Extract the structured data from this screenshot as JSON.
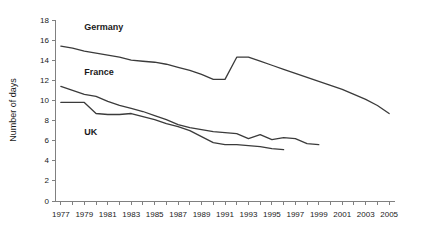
{
  "chart_data": {
    "type": "line",
    "title": "",
    "subtitle": "",
    "xlabel": "",
    "ylabel": "Number of days",
    "xlim": [
      1976.5,
      2005.5
    ],
    "ylim": [
      0,
      18
    ],
    "ytick_step": 2,
    "xtick_step": 1,
    "xlabel_step": 2,
    "grid": false,
    "legend_position": "inline-annotations",
    "yticks": [
      "0",
      "2",
      "4",
      "6",
      "8",
      "10",
      "12",
      "14",
      "16",
      "18"
    ],
    "xticks": [
      "1977",
      "1978",
      "1979",
      "1980",
      "1981",
      "1982",
      "1983",
      "1984",
      "1985",
      "1986",
      "1987",
      "1988",
      "1989",
      "1990",
      "1991",
      "1992",
      "1993",
      "1994",
      "1995",
      "1996",
      "1997",
      "1998",
      "1999",
      "2000",
      "2001",
      "2002",
      "2003",
      "2004",
      "2005"
    ],
    "xtick_labels": [
      "1977",
      "1979",
      "1981",
      "1983",
      "1985",
      "1987",
      "1989",
      "1991",
      "1993",
      "1995",
      "1997",
      "1999",
      "2001",
      "2003",
      "2005"
    ],
    "line_color": "#3b3b3b",
    "axis_color": "#808080",
    "series": [
      {
        "name": "Germany",
        "label": "Germany",
        "label_x": 1979.0,
        "label_y": 17.0,
        "x": [
          1977,
          1978,
          1979,
          1980,
          1981,
          1982,
          1983,
          1984,
          1985,
          1986,
          1987,
          1988,
          1989,
          1990,
          1991,
          1992,
          1993,
          1994,
          1995,
          1996,
          1997,
          1998,
          1999,
          2000,
          2001,
          2002,
          2003,
          2004,
          2005
        ],
        "values": [
          15.4,
          15.2,
          14.9,
          14.7,
          14.5,
          14.3,
          14.0,
          13.9,
          13.8,
          13.6,
          13.3,
          13.0,
          12.6,
          12.1,
          12.1,
          14.3,
          14.3,
          13.9,
          13.5,
          13.1,
          12.7,
          12.3,
          11.9,
          11.5,
          11.1,
          10.6,
          10.1,
          9.5,
          8.7
        ]
      },
      {
        "name": "France",
        "label": "France",
        "label_x": 1979.0,
        "label_y": 12.5,
        "x": [
          1977,
          1978,
          1979,
          1980,
          1981,
          1982,
          1983,
          1984,
          1985,
          1986,
          1987,
          1988,
          1989,
          1990,
          1991,
          1992,
          1993,
          1994,
          1995,
          1996,
          1997,
          1998,
          1999
        ],
        "values": [
          11.4,
          11.0,
          10.6,
          10.4,
          9.9,
          9.5,
          9.2,
          8.9,
          8.5,
          8.1,
          7.6,
          7.3,
          7.1,
          6.9,
          6.8,
          6.7,
          6.2,
          6.6,
          6.1,
          6.3,
          6.2,
          5.7,
          5.6
        ]
      },
      {
        "name": "UK",
        "label": "UK",
        "label_x": 1979.0,
        "label_y": 6.6,
        "x": [
          1977,
          1978,
          1979,
          1980,
          1981,
          1982,
          1983,
          1984,
          1985,
          1986,
          1987,
          1988,
          1989,
          1990,
          1991,
          1992,
          1993,
          1994,
          1995,
          1996
        ],
        "values": [
          9.8,
          9.8,
          9.8,
          8.7,
          8.6,
          8.6,
          8.7,
          8.4,
          8.1,
          7.7,
          7.4,
          7.0,
          6.4,
          5.8,
          5.6,
          5.6,
          5.5,
          5.4,
          5.2,
          5.1
        ]
      }
    ]
  }
}
